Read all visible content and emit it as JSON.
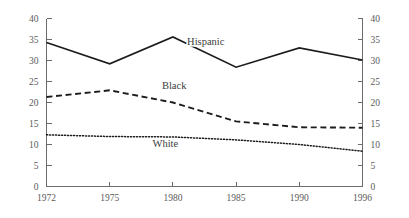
{
  "chart_data": {
    "type": "line",
    "title": "",
    "subtitle": "",
    "xlabel": "",
    "ylabel": "",
    "ylim": [
      0,
      40
    ],
    "grid": false,
    "legend_position": "inline-labels",
    "dual_y_axis": true,
    "categories": [
      "1972",
      "1975",
      "1980",
      "1985",
      "1990",
      "1996"
    ],
    "x_tick_labels": [
      "1972",
      "1975",
      "1980",
      "1985",
      "1990",
      "1996"
    ],
    "y_tick_labels_left": [
      "0",
      "5",
      "10",
      "15",
      "20",
      "25",
      "30",
      "35",
      "40"
    ],
    "y_tick_labels_right": [
      "0",
      "5",
      "10",
      "15",
      "20",
      "25",
      "30",
      "35",
      "40"
    ],
    "y_tick_values": [
      0,
      5,
      10,
      15,
      20,
      25,
      30,
      35,
      40
    ],
    "series": [
      {
        "name": "Hispanic",
        "style": "solid",
        "color": "#1c1c1c",
        "values": [
          34.3,
          29.2,
          35.6,
          28.4,
          33.0,
          30.1
        ],
        "label": "Hispanic",
        "label_at_x": 1982.6,
        "label_at_y": 33.6
      },
      {
        "name": "Black",
        "style": "dashed",
        "color": "#1c1c1c",
        "values": [
          21.3,
          22.9,
          20.0,
          15.5,
          14.1,
          14.0
        ],
        "label": "Black",
        "label_at_x": 1980.1,
        "label_at_y": 23.2
      },
      {
        "name": "White",
        "style": "dotted",
        "color": "#1c1c1c",
        "values": [
          12.3,
          11.9,
          11.8,
          11.1,
          10.0,
          8.4
        ],
        "label": "White",
        "label_at_x": 1979.4,
        "label_at_y": 9.3
      }
    ]
  },
  "axes": {
    "left_axis_name": "left-y-axis",
    "right_axis_name": "right-y-axis",
    "x_axis_name": "x-axis"
  }
}
